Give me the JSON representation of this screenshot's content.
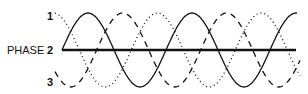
{
  "diagram": {
    "title_label": "PHASE",
    "phase_labels": [
      "1",
      "2",
      "3"
    ],
    "waves": [
      {
        "name": "phase-1",
        "style": "dashed",
        "phase_deg": -120
      },
      {
        "name": "phase-2",
        "style": "solid",
        "phase_deg": 0
      },
      {
        "name": "phase-3",
        "style": "dotted",
        "phase_deg": 120
      }
    ],
    "geometry": {
      "x_start": 62,
      "x_end": 297,
      "baseline_y": 50,
      "amplitude": 37,
      "period_px": 104
    },
    "colors": {
      "line": "#111111",
      "background": "#ffffff"
    }
  }
}
